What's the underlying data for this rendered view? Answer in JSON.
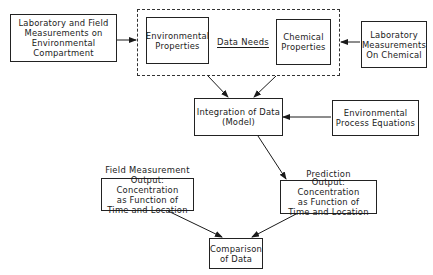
{
  "diagram": {
    "nodes": {
      "lab_field": {
        "text": "Laboratory and Field\nMeasurements on\nEnvironmental\nCompartment"
      },
      "env_props": {
        "text": "Environmental\nProperties"
      },
      "data_needs": {
        "text": "Data Needs"
      },
      "chem_props": {
        "text": "Chemical\nProperties"
      },
      "lab_chem": {
        "text": "Laboratory\nMeasurements\nOn Chemical"
      },
      "integration": {
        "text": "Integration of Data\n(Model)"
      },
      "env_process": {
        "text": "Environmental\nProcess Equations"
      },
      "field_label": {
        "text": "Field Measurement"
      },
      "field_output": {
        "text": "Output: Concentration\nas Function of\nTime and Location"
      },
      "prediction_label": {
        "text": "Prediction"
      },
      "prediction_output": {
        "text": "Output: Concentration\nas Function of\nTime and Location"
      },
      "comparison": {
        "text": "Comparison\nof Data"
      }
    },
    "edges": [
      {
        "from": "lab_field",
        "to": "data_needs_group"
      },
      {
        "from": "lab_chem",
        "to": "data_needs_group"
      },
      {
        "from": "env_props",
        "to": "integration"
      },
      {
        "from": "chem_props",
        "to": "integration"
      },
      {
        "from": "env_process",
        "to": "integration"
      },
      {
        "from": "integration",
        "to": "prediction_output"
      },
      {
        "from": "field_output",
        "to": "comparison"
      },
      {
        "from": "prediction_output",
        "to": "comparison"
      }
    ]
  }
}
